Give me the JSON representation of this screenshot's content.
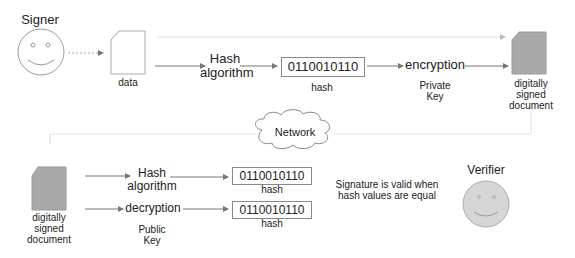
{
  "signer": {
    "title": "Signer",
    "data_label": "data",
    "hash_algorithm_label_line1": "Hash",
    "hash_algorithm_label_line2": "algorithm",
    "hash_value": "0110010110",
    "hash_caption": "hash",
    "encryption_label": "encryption",
    "private_key_line1": "Private",
    "private_key_line2": "Key",
    "signed_doc_line1": "digitally",
    "signed_doc_line2": "signed",
    "signed_doc_line3": "document"
  },
  "network": {
    "label": "Network"
  },
  "verifier": {
    "title": "Verifier",
    "signed_doc_line1": "digitally",
    "signed_doc_line2": "signed",
    "signed_doc_line3": "document",
    "hash_algorithm_label_line1": "Hash",
    "hash_algorithm_label_line2": "algorithm",
    "decryption_label": "decryption",
    "public_key_line1": "Public",
    "public_key_line2": "Key",
    "hash_value_1": "0110010110",
    "hash_caption_1": "hash",
    "hash_value_2": "0110010110",
    "hash_caption_2": "hash",
    "validity_line1": "Signature is valid when",
    "validity_line2": "hash values are equal"
  },
  "colors": {
    "arrow": "#777777",
    "dotted": "#bbbbbb",
    "doc_fill": "#a9a9a9",
    "verifier_face": "#d6d6d6",
    "outline": "#999999"
  }
}
